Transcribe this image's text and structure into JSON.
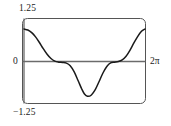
{
  "figure": {
    "kind": "math-function-plot",
    "frame_color": "#555555",
    "axis_color": "#6b6b6b",
    "curve_color": "#1a1a1a",
    "background": "#ffffff"
  },
  "labels": {
    "y_max": "1.25",
    "y_zero": "0",
    "y_min": "−1.25",
    "x_max": "2π"
  },
  "chart_data": {
    "type": "line",
    "title": "",
    "xlabel": "",
    "ylabel": "",
    "xlim": [
      0,
      6.283185
    ],
    "ylim": [
      -1.25,
      1.25
    ],
    "xticks": [
      0,
      6.283185
    ],
    "xticklabels": [
      "0",
      "2π"
    ],
    "yticks": [
      -1.25,
      0,
      1.25
    ],
    "yticklabels": [
      "−1.25",
      "0",
      "1.25"
    ],
    "grid": false,
    "legend": false,
    "zero_line": true,
    "series": [
      {
        "name": "curve",
        "x": [
          0.0,
          0.2,
          0.4,
          0.6,
          0.8,
          1.0,
          1.2,
          1.4,
          1.6,
          1.8,
          2.0,
          2.2,
          2.4,
          2.6,
          2.8,
          3.0,
          3.14,
          3.3,
          3.5,
          3.7,
          3.9,
          4.1,
          4.3,
          4.5,
          4.7,
          4.9,
          5.1,
          5.3,
          5.5,
          5.7,
          5.9,
          6.1,
          6.28
        ],
        "y": [
          0.99,
          0.96,
          0.88,
          0.75,
          0.58,
          0.39,
          0.22,
          0.09,
          0.01,
          -0.02,
          -0.03,
          -0.05,
          -0.13,
          -0.31,
          -0.57,
          -0.84,
          -0.99,
          -1.06,
          -1.02,
          -0.86,
          -0.61,
          -0.35,
          -0.15,
          -0.04,
          -0.02,
          0.0,
          0.05,
          0.16,
          0.34,
          0.56,
          0.76,
          0.92,
          0.99
        ]
      }
    ]
  }
}
